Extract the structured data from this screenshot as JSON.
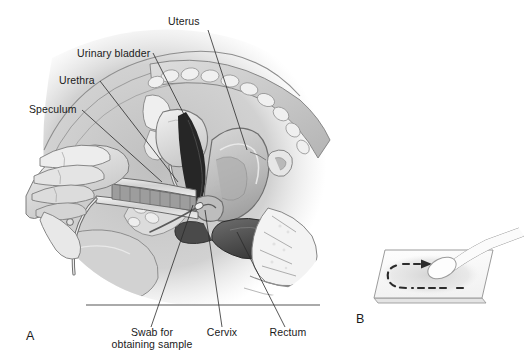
{
  "figure": {
    "background_color": "#ffffff",
    "width": 526,
    "height": 364,
    "ink_color": "#1a1a1a",
    "leader_color": "#2b2b2b"
  },
  "panels": [
    {
      "id": "A",
      "letter": "A",
      "caption": "Sagittal section of the female pelvis during a speculum examination",
      "letter_x": 26,
      "letter_y": 340
    },
    {
      "id": "B",
      "letter": "B",
      "caption": "Swab being rolled across a glass microscope slide",
      "letter_x": 356,
      "letter_y": 323
    }
  ],
  "labels": [
    {
      "name": "uterus",
      "text": "Uterus",
      "text_x": 168,
      "text_y": 25,
      "anchor": "start",
      "leader": "M 208 30 L 247 150"
    },
    {
      "name": "urinary-bladder",
      "text": "Urinary bladder",
      "text_x": 77,
      "text_y": 57,
      "anchor": "start",
      "leader": "M 153 53 L 203 152"
    },
    {
      "name": "urethra",
      "text": "Urethra",
      "text_x": 59,
      "text_y": 84,
      "anchor": "start",
      "leader": "M 100 81 L 178 182"
    },
    {
      "name": "speculum",
      "text": "Speculum",
      "text_x": 29,
      "text_y": 113,
      "anchor": "start",
      "leader": "M 82 110 L 162 182"
    },
    {
      "name": "swab-for-obtaining-sample",
      "text": "Swab for",
      "text2": "obtaining sample",
      "text_x": 152,
      "text_y": 336,
      "text2_y": 348,
      "anchor": "middle",
      "leader": "M 151 327 L 193 205"
    },
    {
      "name": "cervix",
      "text": "Cervix",
      "text_x": 222,
      "text_y": 336,
      "anchor": "middle",
      "leader": "M 222 327 L 205 210"
    },
    {
      "name": "rectum",
      "text": "Rectum",
      "text_x": 288,
      "text_y": 336,
      "anchor": "middle",
      "leader": "M 285 327 L 237 232"
    }
  ],
  "panel_b": {
    "slide_label": "glass-microscope-slide",
    "smear_label": "specimen-smear",
    "arrow_label": "smear-direction-arrow",
    "swab_label": "cotton-tipped-swab"
  },
  "colors": {
    "tissue_light": "#e8e8e8",
    "tissue_mid": "#c9c9c9",
    "tissue_dark": "#9a9a9a",
    "cavity_dark": "#2e2e2e",
    "outline": "#6b6b6b",
    "slide_fill": "#fbfbfb",
    "slide_edge": "#9b9b9b",
    "smear_gray": "#dcdcdc"
  }
}
